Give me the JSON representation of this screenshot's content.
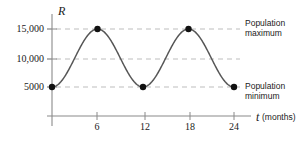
{
  "chart_data": {
    "type": "line",
    "title": "",
    "subtitle": "",
    "xlabel_symbol": "t",
    "xlabel_units": "(months)",
    "ylabel_symbol": "R",
    "ylabel_units": "",
    "grid": true,
    "legend_position": "none",
    "xlim": [
      0,
      26
    ],
    "ylim": [
      0,
      17500
    ],
    "xticks": [
      {
        "value": 6,
        "label": "6"
      },
      {
        "value": 12,
        "label": "12"
      },
      {
        "value": 18,
        "label": "18"
      },
      {
        "value": 24,
        "label": "24"
      }
    ],
    "yticks": [
      {
        "value": 5000,
        "label": "5000"
      },
      {
        "value": 10000,
        "label": "10,000"
      },
      {
        "value": 15000,
        "label": "15,000"
      }
    ],
    "gridlines_y": [
      5000,
      10000,
      15000
    ],
    "series": [
      {
        "name": "R(t)",
        "color": "#555555",
        "description": "sinusoidal population curve with period 12 months, minimum 5000, maximum 15,000",
        "function": "R(t) = 10000 - 5000*cos(pi*t/6)",
        "period_months": 12,
        "amplitude": 5000,
        "midline": 10000,
        "marked_points": [
          {
            "x": 0,
            "y": 5000
          },
          {
            "x": 6,
            "y": 15000
          },
          {
            "x": 12,
            "y": 5000
          },
          {
            "x": 18,
            "y": 15000
          },
          {
            "x": 24,
            "y": 5000
          }
        ]
      }
    ],
    "annotations": [
      {
        "id": "population-maximum",
        "line1": "Population",
        "line2": "maximum",
        "at_y": 15000
      },
      {
        "id": "population-minimum",
        "line1": "Population",
        "line2": "minimum",
        "at_y": 5000
      }
    ],
    "colors": {
      "curve": "#555555",
      "axis": "#8a8a8a",
      "gridline": "#b5b5b5",
      "marker": "#111111",
      "text": "#1a1a1a",
      "background": "#ffffff"
    }
  }
}
